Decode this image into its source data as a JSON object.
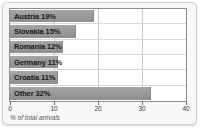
{
  "chart_data": {
    "type": "bar",
    "orientation": "horizontal",
    "title": "",
    "xlabel": "% of total arrivals",
    "ylabel": "",
    "xlim": [
      0,
      40
    ],
    "xticks": [
      0,
      10,
      20,
      30,
      40
    ],
    "xtick_labels": [
      "0",
      "10",
      "20",
      "30",
      "40"
    ],
    "grid": true,
    "legend": false,
    "categories": [
      "Austria",
      "Slovakia",
      "Romania",
      "Germany",
      "Croatia",
      "Other"
    ],
    "values": [
      19,
      15,
      12,
      11,
      11,
      32
    ],
    "bar_labels": [
      "Austria 19%",
      "Slovakia 15%",
      "Romania 12%",
      "Germany 11%",
      "Croatia 11%",
      "Other 32%"
    ],
    "bar_color": "#999999",
    "label_color": "#1a1a1a",
    "grid_color": "#c9c9c9",
    "plot_background": "#ffffff",
    "card_background": "#f7f7f5",
    "border_color": "#8e8e8e"
  }
}
